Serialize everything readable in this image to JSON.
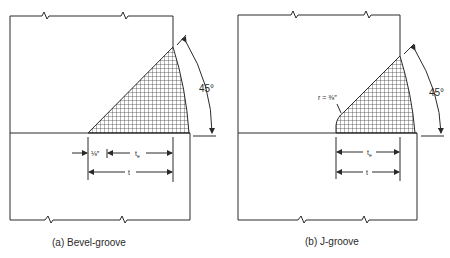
{
  "figure": {
    "panels": [
      {
        "id": "a",
        "caption": "(a)  Bevel-groove",
        "angle_label": "45°",
        "root_gap_label": "⅛″",
        "effective_throat_label": "tₑ",
        "te_main": "t",
        "te_sub": "e",
        "thickness_label": "t"
      },
      {
        "id": "b",
        "caption": "(b)  J-groove",
        "angle_label": "45°",
        "radius_label": "r = ⅜″",
        "te_main": "t",
        "te_sub": "e",
        "thickness_label": "t"
      }
    ]
  },
  "colors": {
    "line": "#2a2a2a",
    "background": "#ffffff"
  }
}
